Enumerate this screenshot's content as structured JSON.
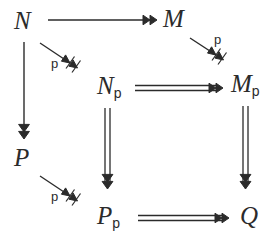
{
  "diagram": {
    "type": "commutative-diagram",
    "title": "",
    "background_color": "#ffffff",
    "ink_color": "#2b2b2b",
    "nodes": [
      {
        "id": "N",
        "base": "N",
        "sub": "",
        "x": 14,
        "y": 8,
        "label": "N"
      },
      {
        "id": "M",
        "base": "M",
        "sub": "",
        "x": 163,
        "y": 6,
        "label": "M"
      },
      {
        "id": "Np",
        "base": "N",
        "sub": "p",
        "x": 97,
        "y": 73,
        "label": "N_p"
      },
      {
        "id": "Mp",
        "base": "M",
        "sub": "p",
        "x": 231,
        "y": 71,
        "label": "M_p"
      },
      {
        "id": "P",
        "base": "P",
        "sub": "",
        "x": 14,
        "y": 145,
        "label": "P"
      },
      {
        "id": "Pp",
        "base": "P",
        "sub": "p",
        "x": 97,
        "y": 203,
        "label": "P_p"
      },
      {
        "id": "Q",
        "base": "Q",
        "sub": "",
        "x": 240,
        "y": 203,
        "label": "Q"
      }
    ],
    "edges": [
      {
        "id": "N-to-M",
        "from": "N",
        "to": "M",
        "style": "single-line",
        "head": "double-arrowhead",
        "label": ""
      },
      {
        "id": "N-to-Np",
        "from": "N",
        "to": "Np",
        "style": "single-line",
        "head": "slashed-double-arrowhead",
        "label": "p"
      },
      {
        "id": "M-to-Mp",
        "from": "M",
        "to": "Mp",
        "style": "single-line",
        "head": "slashed-double-arrowhead",
        "label": "p"
      },
      {
        "id": "N-to-P",
        "from": "N",
        "to": "P",
        "style": "single-line",
        "head": "stacked-double-arrowhead",
        "label": ""
      },
      {
        "id": "Np-to-Mp",
        "from": "Np",
        "to": "Mp",
        "style": "double-line",
        "head": "double-arrowhead",
        "label": ""
      },
      {
        "id": "Np-to-Pp",
        "from": "Np",
        "to": "Pp",
        "style": "double-line",
        "head": "stacked-double-arrowhead",
        "label": ""
      },
      {
        "id": "Mp-to-Q",
        "from": "Mp",
        "to": "Q",
        "style": "double-line",
        "head": "stacked-double-arrowhead",
        "label": ""
      },
      {
        "id": "P-to-Pp",
        "from": "P",
        "to": "Pp",
        "style": "single-line",
        "head": "slashed-double-arrowhead",
        "label": "p"
      },
      {
        "id": "Pp-to-Q",
        "from": "Pp",
        "to": "Q",
        "style": "double-line",
        "head": "double-arrowhead",
        "label": ""
      }
    ],
    "edge_labels": [
      {
        "id": "label-N-Np",
        "text": "p",
        "x": 51,
        "y": 57
      },
      {
        "id": "label-M-Mp",
        "text": "p",
        "x": 214,
        "y": 33
      },
      {
        "id": "label-P-Pp",
        "text": "p",
        "x": 51,
        "y": 190
      }
    ]
  }
}
